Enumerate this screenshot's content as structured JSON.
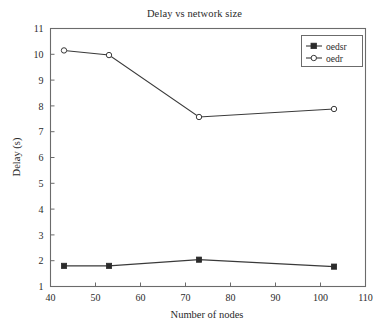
{
  "chart_data": {
    "type": "line",
    "title": "Delay vs network size",
    "xlabel": "Number of nodes",
    "ylabel": "Delay (s)",
    "xlim": [
      40,
      110
    ],
    "ylim": [
      1,
      11
    ],
    "xticks": [
      40,
      50,
      60,
      70,
      80,
      90,
      100,
      110
    ],
    "xtick_labels": [
      "40",
      "50",
      "60",
      "70",
      "80",
      "90",
      "100",
      "110"
    ],
    "yticks": [
      1,
      2,
      3,
      4,
      5,
      6,
      7,
      8,
      9,
      10,
      11
    ],
    "ytick_labels": [
      "1",
      "2",
      "3",
      "4",
      "5",
      "6",
      "7",
      "8",
      "9",
      "10",
      "11"
    ],
    "grid": false,
    "legend_position": "upper right",
    "x": [
      43,
      53,
      73,
      103
    ],
    "series": [
      {
        "name": "oedsr",
        "marker": "filled-square",
        "color": "#2b2b2b",
        "values": [
          1.8,
          1.8,
          2.04,
          1.77
        ]
      },
      {
        "name": "oedr",
        "marker": "open-circle",
        "color": "#3a3a3a",
        "values": [
          10.15,
          9.97,
          7.57,
          7.88
        ]
      }
    ]
  },
  "legend": {
    "entries": [
      {
        "label": "oedsr"
      },
      {
        "label": "oedr"
      }
    ]
  },
  "colors": {
    "axis": "#6b6b6b",
    "text": "#2a2a2a",
    "line": "#3a3a3a",
    "background": "#ffffff"
  }
}
